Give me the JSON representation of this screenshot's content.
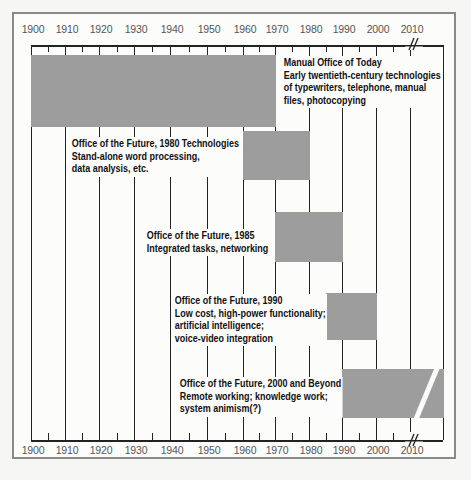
{
  "chart_data": {
    "type": "timeline",
    "title": "",
    "xlabel": "",
    "axis_ticks": [
      "1900",
      "1910",
      "1920",
      "1930",
      "1940",
      "1950",
      "1960",
      "1970",
      "1980",
      "1990",
      "2000",
      "2010"
    ],
    "axis_break_after": "2010",
    "grid": true,
    "items": [
      {
        "name": "Manual Office of Today",
        "start": 1900,
        "end": 1970,
        "lines": [
          "Manual Office of Today",
          "Early twentieth-century technologies",
          "of typewriters, telephone, manual",
          "files, photocopying"
        ]
      },
      {
        "name": "Office of the Future, 1980 Technologies",
        "start": 1960,
        "end": 1980,
        "lines": [
          "Office of the Future, 1980 Technologies",
          "Stand-alone word processing,",
          "data analysis, etc."
        ]
      },
      {
        "name": "Office of the Future, 1985",
        "start": 1970,
        "end": 1990,
        "lines": [
          "Office of the Future, 1985",
          "Integrated tasks, networking"
        ]
      },
      {
        "name": "Office of the Future, 1990",
        "start": 1985,
        "end": 2000,
        "lines": [
          "Office of the Future, 1990",
          "Low cost, high-power functionality;",
          "artificial intelligence;",
          "voice-video integration"
        ]
      },
      {
        "name": "Office of the Future, 2000 and Beyond",
        "start": 1990,
        "end": "beyond",
        "lines": [
          "Office of the Future, 2000 and Beyond",
          "Remote working; knowledge work;",
          "system animism(?)"
        ]
      }
    ],
    "colors": {
      "bar": "#9d9d9d",
      "line": "#222222",
      "frame": "#8a8a8a"
    }
  },
  "axis": {
    "top_labels": [
      "1900",
      "1910",
      "1920",
      "1930",
      "1940",
      "1950",
      "1960",
      "1970",
      "1980",
      "1990",
      "2000",
      "2010"
    ],
    "bottom_labels": [
      "1900",
      "1910",
      "1920",
      "1930",
      "1940",
      "1950",
      "1960",
      "1970",
      "1980",
      "1990",
      "2000",
      "2010"
    ],
    "break_symbol": "//"
  },
  "labels": {
    "manual": [
      "Manual Office of Today",
      "Early twentieth-century technologies",
      "of typewriters, telephone, manual",
      "files, photocopying"
    ],
    "f1980": [
      "Office of the Future, 1980 Technologies",
      "Stand-alone word processing,",
      "data analysis, etc."
    ],
    "f1985": [
      "Office of the Future, 1985",
      "Integrated tasks, networking"
    ],
    "f1990": [
      "Office of the Future, 1990",
      "Low cost, high-power functionality;",
      "artificial intelligence;",
      "voice-video integration"
    ],
    "f2000": [
      "Office of the Future, 2000 and Beyond",
      "Remote working; knowledge work;",
      "system animism(?)"
    ]
  }
}
